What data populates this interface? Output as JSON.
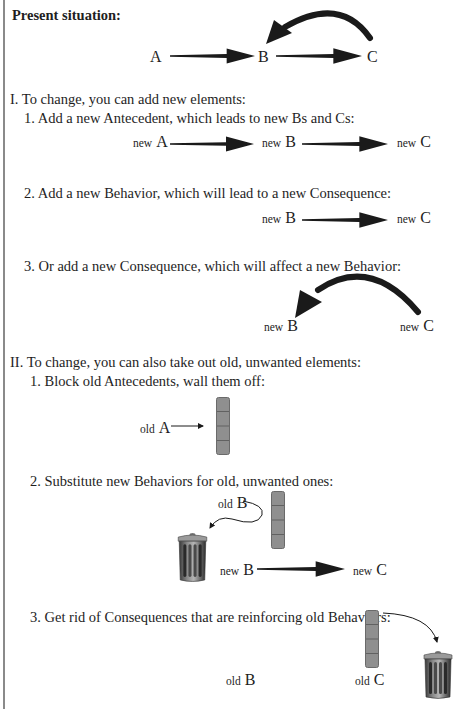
{
  "heading": "Present situation:",
  "top_diagram": {
    "a": "A",
    "b": "B",
    "c": "C"
  },
  "section_1": {
    "title": "I.  To change, you can add new elements:",
    "item_1": "1. Add a new Antecedent, which leads to new Bs and Cs:",
    "item_2": "2. Add a new Behavior, which will lead to a new Consequence:",
    "item_3": "3. Or add a new Consequence, which will affect a new Behavior:"
  },
  "section_2": {
    "title": "II.  To change, you can also take out old, unwanted elements:",
    "item_1": "1. Block old Antecedents, wall them off:",
    "item_2": "2. Substitute new Behaviors for old, unwanted ones:",
    "item_3": "3. Get rid of Consequences that are reinforcing old Behaviors:"
  },
  "labels": {
    "new": "new",
    "old": "old",
    "A": "A",
    "B": "B",
    "C": "C"
  },
  "colors": {
    "arrow": "#1a1a1a",
    "wall": "#8f8f8f",
    "wall_line": "#555555",
    "border": "#8a8a8a"
  }
}
